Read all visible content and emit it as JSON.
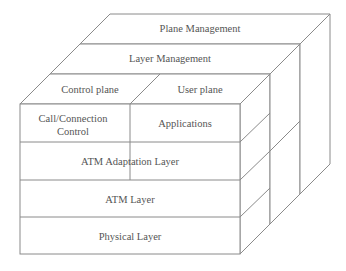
{
  "diagram": {
    "type": "3D layered cube",
    "top_layers": {
      "plane_management": "Plane Management",
      "layer_management": "Layer Management",
      "control_plane": "Control plane",
      "user_plane": "User plane"
    },
    "front_layers": {
      "call_connection_line1": "Call/Connection",
      "call_connection_line2": "Control",
      "applications": "Applications",
      "aal": "ATM Adaptation Layer",
      "atm": "ATM Layer",
      "physical": "Physical Layer"
    },
    "colors": {
      "line": "#8a8a8a",
      "text": "#555555",
      "background": "#ffffff"
    }
  }
}
